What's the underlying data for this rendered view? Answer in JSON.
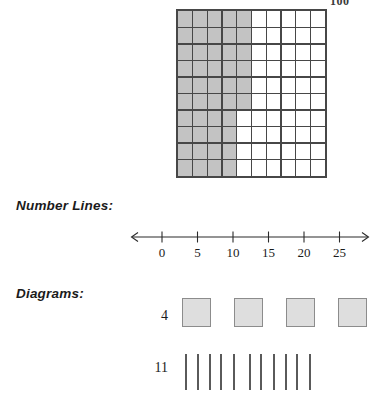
{
  "page": {
    "background_color": "#ffffff",
    "width": 391,
    "height": 408
  },
  "top_caption": {
    "text": "100",
    "note": "partially cut off at top edge of image"
  },
  "hundred_grid": {
    "columns": 10,
    "rows": 10,
    "total_cells": 100,
    "shaded_count": 46,
    "shaded_color": "#c3c3c3",
    "unshaded_color": "#ffffff",
    "line_color": "#474747",
    "shaded_per_row": [
      5,
      5,
      5,
      5,
      5,
      5,
      4,
      4,
      4,
      4
    ]
  },
  "sections": {
    "number_lines_label": "Number Lines:",
    "diagrams_label": "Diagrams:"
  },
  "number_line": {
    "ticks": [
      0,
      5,
      10,
      15,
      20,
      25
    ],
    "tick_labels": [
      "0",
      "5",
      "10",
      "15",
      "20",
      "25"
    ],
    "left_arrow": true,
    "right_arrow": true,
    "axis_color": "#2a2a2a"
  },
  "diagrams": {
    "rows": [
      {
        "label": "4",
        "kind": "squares",
        "count": 4,
        "fill_color": "#dedede",
        "border_color": "#8c8c8c"
      },
      {
        "label": "11",
        "kind": "tally-marks",
        "count": 11,
        "stroke_color": "#5a5a5a"
      }
    ]
  },
  "chart_data": {
    "type": "table",
    "items": [
      {
        "representation": "hundred-grid",
        "shaded": 46,
        "total": 100,
        "caption": "100"
      },
      {
        "representation": "number-line",
        "tick_values": [
          0,
          5,
          10,
          15,
          20,
          25
        ],
        "min": 0,
        "max": 25,
        "step": 5
      },
      {
        "representation": "diagram-squares",
        "label": "4",
        "value": 4
      },
      {
        "representation": "diagram-tally",
        "label": "11",
        "value": 11
      }
    ]
  }
}
